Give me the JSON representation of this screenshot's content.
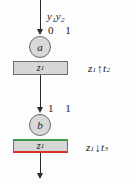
{
  "diagram": {
    "colors": {
      "stroke": "#2b2b2b",
      "node_fill": "#d8d8d8",
      "box_fill": "#d6d6d6",
      "box_border": "#6e6e6e",
      "marked_top": "#3f9a4a",
      "marked_bottom": "#d8302a",
      "background": "#fdfdfd"
    },
    "input_label": {
      "variables": "y₁y₂",
      "y1_base": "y",
      "y1_sub": "1",
      "y2_base": "y",
      "y2_sub": "2",
      "values": "0 1"
    },
    "middle_label": {
      "values": "1 1"
    },
    "nodes": [
      {
        "id": "node-a",
        "label": "a"
      },
      {
        "id": "node-b",
        "label": "b"
      }
    ],
    "boxes": [
      {
        "id": "box-z1-upper",
        "base": "z",
        "sub": "1",
        "marked": false
      },
      {
        "id": "box-z1-lower",
        "base": "z",
        "sub": "1",
        "marked": true
      }
    ],
    "annotations": [
      {
        "id": "annot-z1-up-t2",
        "base": "z",
        "sub": "1",
        "arrow": "↑",
        "arrow_name": "up-arrow",
        "target_base": "t",
        "target_sub": "2"
      },
      {
        "id": "annot-z1-down-t3",
        "base": "z",
        "sub": "1",
        "arrow": "↓",
        "arrow_name": "down-arrow",
        "target_base": "t",
        "target_sub": "3"
      }
    ]
  }
}
